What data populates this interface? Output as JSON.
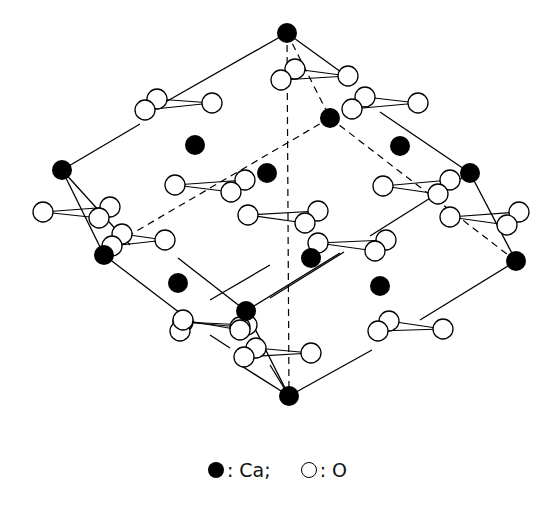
{
  "figure": {
    "colors": {
      "ca": "#000000",
      "o_fill": "#ffffff",
      "o_stroke": "#000000",
      "line": "#000000",
      "background": "#ffffff"
    }
  },
  "legend": {
    "items": [
      {
        "symbol": "filled-circle",
        "label": ": Ca;"
      },
      {
        "symbol": "open-circle",
        "label": ": O"
      }
    ]
  },
  "atoms": {
    "ca": [
      [
        287,
        33
      ],
      [
        330,
        118
      ],
      [
        195,
        145
      ],
      [
        400,
        146
      ],
      [
        62,
        170
      ],
      [
        267,
        173
      ],
      [
        470,
        173
      ],
      [
        104,
        255
      ],
      [
        311,
        258
      ],
      [
        516,
        261
      ],
      [
        178,
        283
      ],
      [
        380,
        286
      ],
      [
        246,
        311
      ],
      [
        289,
        396
      ]
    ],
    "o_groups": [
      {
        "apex": [
          212,
          103
        ],
        "pair": [
          [
            157,
            99
          ],
          [
            145,
            110
          ]
        ]
      },
      {
        "apex": [
          348,
          76
        ],
        "pair": [
          [
            295,
            69
          ],
          [
            281,
            80
          ]
        ]
      },
      {
        "apex": [
          418,
          103
        ],
        "pair": [
          [
            365,
            97
          ],
          [
            352,
            109
          ]
        ]
      },
      {
        "apex": [
          175,
          185
        ],
        "pair": [
          [
            245,
            180
          ],
          [
            231,
            192
          ]
        ]
      },
      {
        "apex": [
          383,
          186
        ],
        "pair": [
          [
            450,
            180
          ],
          [
            438,
            194
          ]
        ]
      },
      {
        "apex": [
          43,
          212
        ],
        "pair": [
          [
            110,
            207
          ],
          [
            99,
            218
          ]
        ]
      },
      {
        "apex": [
          248,
          215
        ],
        "pair": [
          [
            318,
            211
          ],
          [
            305,
            223
          ]
        ]
      },
      {
        "apex": [
          450,
          217
        ],
        "pair": [
          [
            519,
            212
          ],
          [
            507,
            225
          ]
        ]
      },
      {
        "apex": [
          165,
          240
        ],
        "pair": [
          [
            122,
            234
          ],
          [
            112,
            246
          ]
        ]
      },
      {
        "apex": [
          318,
          243
        ],
        "pair": [
          [
            386,
            240
          ],
          [
            375,
            251
          ]
        ]
      },
      {
        "apex": [
          183,
          322
        ],
        "pair": [
          [
            247,
            325
          ],
          [
            240,
            327
          ]
        ]
      },
      {
        "apex": [
          183,
          320
        ],
        "pair": [
          [
            180,
            331
          ],
          [
            240,
            330
          ]
        ]
      },
      {
        "apex": [
          311,
          353
        ],
        "pair": [
          [
            256,
            348
          ],
          [
            244,
            357
          ]
        ]
      },
      {
        "apex": [
          443,
          329
        ],
        "pair": [
          [
            389,
            321
          ],
          [
            378,
            331
          ]
        ]
      }
    ]
  }
}
